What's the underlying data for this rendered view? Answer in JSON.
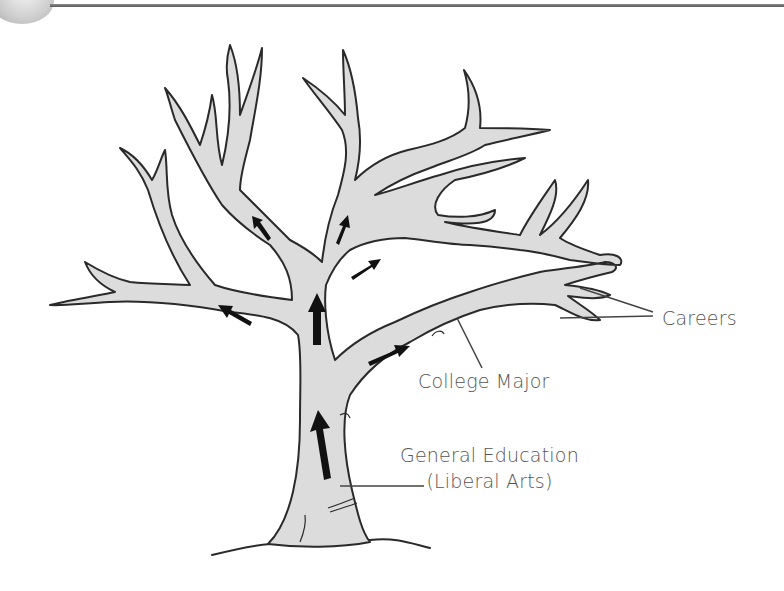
{
  "diagram": {
    "labels": {
      "careers": "Careers",
      "college_major": "College Major",
      "general_education_line1": "General Education",
      "general_education_line2": "(Liberal Arts)"
    },
    "colors": {
      "tree_fill": "#dcdcdc",
      "tree_outline": "#2a2a2a",
      "arrow": "#111111",
      "label_text": "#555555",
      "header_rule": "#6a6a6a"
    }
  }
}
